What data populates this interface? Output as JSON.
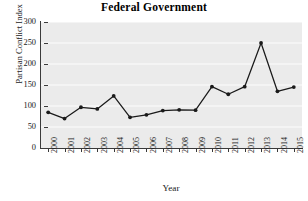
{
  "chart_data": {
    "type": "line",
    "title": "Federal Government",
    "xlabel": "Year",
    "ylabel": "Partisan Conflict Index",
    "categories": [
      "2000",
      "2001",
      "2002",
      "2003",
      "2004",
      "2005",
      "2006",
      "2007",
      "2008",
      "2009",
      "2010",
      "2011",
      "2012",
      "2013",
      "2014",
      "2015"
    ],
    "values": [
      85,
      70,
      97,
      93,
      124,
      73,
      79,
      89,
      91,
      90,
      146,
      128,
      146,
      250,
      135,
      145
    ],
    "ylim": [
      0,
      300
    ],
    "yticks": [
      0,
      50,
      100,
      150,
      200,
      250,
      300
    ],
    "ytick_labels": [
      "0",
      "50",
      "100",
      "150",
      "200",
      "250",
      "300"
    ],
    "grid": true,
    "grid_axis": "y",
    "legend": "none",
    "marker": "circle",
    "line_color": "#1a1a1a",
    "marker_color": "#1a1a1a",
    "plot_background": "#ebebeb",
    "grid_color": "#ffffff",
    "figure_background": "#ffffff"
  }
}
